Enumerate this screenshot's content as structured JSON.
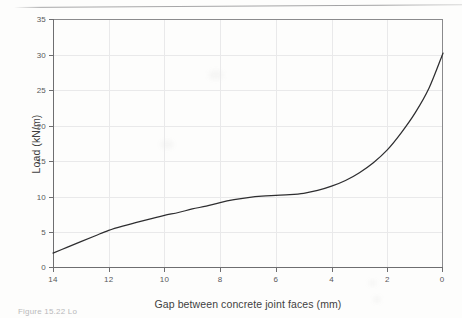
{
  "figure": {
    "caption_partial": "Figure 15.22   Lo",
    "background_color": "#fdfdfc",
    "curve_color": "#2e2e30",
    "grid_color": "#e9e9ea",
    "axis_color": "#6e6e70"
  },
  "chart_data": {
    "type": "line",
    "title": "",
    "xlabel": "Gap between concrete joint faces (mm)",
    "ylabel": "Load (kN/m)",
    "xlim": [
      14,
      0
    ],
    "ylim": [
      0,
      35
    ],
    "x_ticks": [
      14,
      12,
      10,
      8,
      6,
      4,
      2,
      0
    ],
    "y_ticks": [
      0,
      5,
      10,
      15,
      20,
      25,
      30,
      35
    ],
    "x_tick_labels": [
      "14",
      "12",
      "10",
      "8",
      "6",
      "4",
      "2",
      "0"
    ],
    "y_tick_labels": [
      "0",
      "5",
      "10",
      "15",
      "20",
      "25",
      "30",
      "35"
    ],
    "x_axis_reversed": true,
    "grid": true,
    "legend": false,
    "series": [
      {
        "name": "Load vs gap",
        "x": [
          14.0,
          13.5,
          13.0,
          12.5,
          12.0,
          11.5,
          11.0,
          10.5,
          10.0,
          9.5,
          9.0,
          8.5,
          8.0,
          7.5,
          7.0,
          6.5,
          6.0,
          5.5,
          5.0,
          4.5,
          4.0,
          3.5,
          3.0,
          2.5,
          2.0,
          1.5,
          1.0,
          0.5,
          0.0
        ],
        "y": [
          2.1,
          2.9,
          3.7,
          4.5,
          5.3,
          5.9,
          6.4,
          6.9,
          7.4,
          7.8,
          8.3,
          8.7,
          9.2,
          9.6,
          9.9,
          10.1,
          10.2,
          10.3,
          10.5,
          10.9,
          11.5,
          12.3,
          13.4,
          14.8,
          16.6,
          19.0,
          21.8,
          25.3,
          30.2
        ]
      }
    ],
    "annotations": []
  }
}
